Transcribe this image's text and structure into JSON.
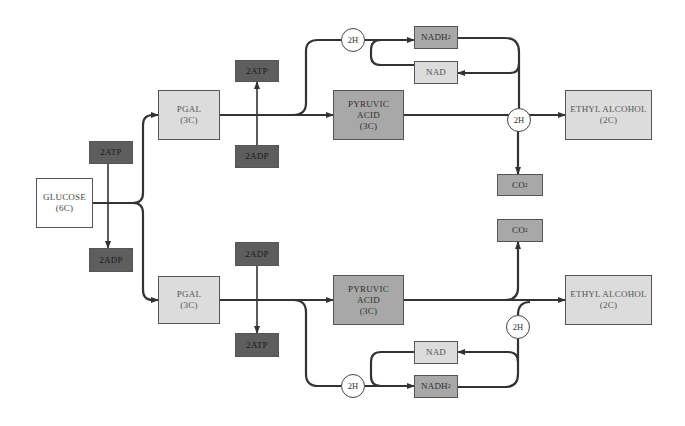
{
  "diagram": {
    "type": "metabolic-pathway",
    "colors": {
      "line": "#333333",
      "white_box": "#ffffff",
      "light_box": "#dcdcdc",
      "mid_box": "#a8a8a8",
      "dark_box": "#5e5e5e"
    },
    "glucose": {
      "label": "GLUCOSE",
      "sub": "(6C)"
    },
    "left_atp": {
      "label": "2ATP"
    },
    "left_adp": {
      "label": "2ADP"
    },
    "top": {
      "pgal": {
        "label": "PGAL",
        "sub": "(3C)"
      },
      "atp": {
        "label": "2ATP"
      },
      "adp": {
        "label": "2ADP"
      },
      "pyruvic": {
        "line1": "PYRUVIC",
        "line2": "ACID",
        "sub": "(3C)"
      },
      "h_left": {
        "label": "2H"
      },
      "h_right": {
        "label": "2H"
      },
      "nadh2": {
        "label": "NADH",
        "subscript": "2"
      },
      "nad": {
        "label": "NAD"
      },
      "ethyl": {
        "label": "ETHYL ALCOHOL",
        "sub": "(2C)"
      },
      "co2": {
        "label": "CO",
        "subscript": "2"
      }
    },
    "bottom": {
      "pgal": {
        "label": "PGAL",
        "sub": "(3C)"
      },
      "adp": {
        "label": "2ADP"
      },
      "atp": {
        "label": "2ATP"
      },
      "pyruvic": {
        "line1": "PYRUVIC",
        "line2": "ACID",
        "sub": "(3C)"
      },
      "h_left": {
        "label": "2H"
      },
      "h_right": {
        "label": "2H"
      },
      "nad": {
        "label": "NAD"
      },
      "nadh2": {
        "label": "NADH",
        "subscript": "2"
      },
      "ethyl": {
        "label": "ETHYL ALCOHOL",
        "sub": "(2C)"
      },
      "co2": {
        "label": "CO",
        "subscript": "2"
      }
    }
  }
}
